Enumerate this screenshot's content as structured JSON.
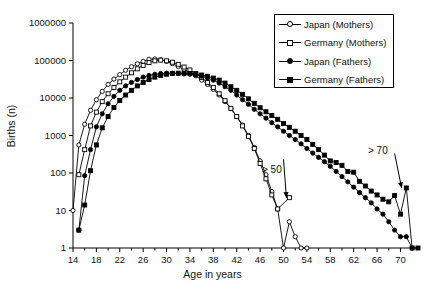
{
  "chart_data": {
    "type": "line",
    "title": "",
    "xlabel": "Age in years",
    "ylabel": "Births (n)",
    "yscale": "log",
    "ylim": [
      1,
      1000000
    ],
    "xlim": [
      14,
      73
    ],
    "yticks": [
      1,
      10,
      100,
      1000,
      10000,
      100000,
      1000000
    ],
    "ytick_labels": [
      "1",
      "10",
      "100",
      "1000",
      "10000",
      "100000",
      "1000000"
    ],
    "xticks": [
      14,
      18,
      22,
      26,
      30,
      34,
      38,
      42,
      46,
      50,
      54,
      58,
      62,
      66,
      70
    ],
    "xtick_labels": [
      "14",
      "18",
      "22",
      "26",
      "30",
      "34",
      "38",
      "42",
      "46",
      "50",
      "54",
      "58",
      "62",
      "66",
      "70"
    ],
    "x_minor_step": 2,
    "grid": false,
    "legend_position": "top-right",
    "annotations": [
      {
        "text": "> 50",
        "x": 50.5,
        "y": 22,
        "label_x": 50.0,
        "label_y": 230
      },
      {
        "text": "> 70",
        "x": 70.2,
        "y": 40,
        "label_x": 69.0,
        "label_y": 330
      }
    ],
    "series": [
      {
        "name": "Japan (Mothers)",
        "marker": "circle-open",
        "x": [
          14,
          15,
          16,
          17,
          18,
          19,
          20,
          21,
          22,
          23,
          24,
          25,
          26,
          27,
          28,
          29,
          30,
          31,
          32,
          33,
          34,
          35,
          36,
          37,
          38,
          39,
          40,
          41,
          42,
          43,
          44,
          45,
          46,
          47,
          48,
          49,
          50,
          51,
          52,
          53,
          54
        ],
        "y": [
          10,
          560,
          2000,
          4700,
          9000,
          15000,
          23000,
          32000,
          42000,
          55000,
          68000,
          82000,
          95000,
          108000,
          110000,
          105000,
          95000,
          82000,
          69000,
          58000,
          48000,
          39000,
          30000,
          23000,
          17000,
          12000,
          8000,
          5200,
          3200,
          1900,
          1000,
          480,
          210,
          90,
          32,
          11,
          1,
          5,
          2,
          1,
          1
        ]
      },
      {
        "name": "Germany (Mothers)",
        "marker": "square-open",
        "x": [
          15,
          16,
          17,
          18,
          19,
          20,
          21,
          22,
          23,
          24,
          25,
          26,
          27,
          28,
          29,
          30,
          31,
          32,
          33,
          34,
          35,
          36,
          37,
          38,
          39,
          40,
          41,
          42,
          43,
          44,
          45,
          46,
          47,
          48,
          49,
          51
        ],
        "y": [
          90,
          420,
          1800,
          4200,
          8000,
          13000,
          19000,
          27000,
          36000,
          47000,
          60000,
          74000,
          88000,
          98000,
          102000,
          98000,
          90000,
          79000,
          67000,
          56000,
          45000,
          35000,
          26000,
          19000,
          13000,
          8500,
          5300,
          3200,
          1800,
          950,
          450,
          180,
          70,
          26,
          11,
          22
        ]
      },
      {
        "name": "Japan (Fathers)",
        "marker": "circle-filled",
        "x": [
          15,
          16,
          17,
          18,
          19,
          20,
          21,
          22,
          23,
          24,
          25,
          26,
          27,
          28,
          29,
          30,
          31,
          32,
          33,
          34,
          35,
          36,
          37,
          38,
          39,
          40,
          41,
          42,
          43,
          44,
          45,
          46,
          47,
          48,
          49,
          50,
          51,
          52,
          53,
          54,
          55,
          56,
          57,
          58,
          59,
          60,
          61,
          62,
          63,
          64,
          65,
          66,
          67,
          68,
          69,
          70,
          71,
          72
        ],
        "y": [
          3,
          85,
          420,
          1700,
          3800,
          7000,
          11000,
          16000,
          21000,
          26000,
          31000,
          36000,
          40000,
          43000,
          45000,
          46000,
          46000,
          45000,
          44000,
          43000,
          41000,
          38000,
          34000,
          30000,
          25000,
          20000,
          16000,
          12000,
          9000,
          6800,
          5000,
          3800,
          2900,
          2200,
          1700,
          1300,
          1000,
          780,
          600,
          450,
          340,
          260,
          200,
          150,
          110,
          80,
          58,
          42,
          30,
          22,
          16,
          11,
          8,
          5,
          3,
          2,
          2,
          1
        ]
      },
      {
        "name": "Germany (Fathers)",
        "marker": "square-filled",
        "x": [
          15,
          16,
          17,
          18,
          19,
          20,
          21,
          22,
          23,
          24,
          25,
          26,
          27,
          28,
          29,
          30,
          31,
          32,
          33,
          34,
          35,
          36,
          37,
          38,
          39,
          40,
          41,
          42,
          43,
          44,
          45,
          46,
          47,
          48,
          49,
          50,
          51,
          52,
          53,
          54,
          55,
          56,
          57,
          58,
          59,
          60,
          61,
          62,
          63,
          64,
          65,
          66,
          67,
          68,
          69,
          70,
          71,
          72,
          73
        ],
        "y": [
          3,
          14,
          115,
          560,
          1600,
          3200,
          5600,
          8600,
          12000,
          16000,
          21000,
          26000,
          31000,
          36000,
          40000,
          43000,
          45000,
          46000,
          46000,
          45000,
          43000,
          41000,
          38000,
          34000,
          30000,
          25000,
          20000,
          16000,
          12500,
          9500,
          7200,
          5500,
          4300,
          3400,
          2700,
          2100,
          1650,
          1300,
          1000,
          780,
          580,
          420,
          300,
          210,
          190,
          160,
          110,
          105,
          60,
          45,
          33,
          26,
          20,
          17,
          25,
          8,
          40,
          1,
          1
        ]
      }
    ]
  },
  "axes": {
    "x_title": "Age in years",
    "y_title": "Births (n)"
  },
  "legend": {
    "entries": [
      {
        "label": "Japan (Mothers)",
        "marker": "circle-open"
      },
      {
        "label": "Germany (Mothers)",
        "marker": "square-open"
      },
      {
        "label": "Japan (Fathers)",
        "marker": "circle-filled"
      },
      {
        "label": "Germany (Fathers)",
        "marker": "square-filled"
      }
    ]
  },
  "annotations": {
    "gt50": "> 50",
    "gt70": "> 70"
  },
  "colors": {
    "line": "#000000",
    "background": "#ffffff",
    "axis": "#000000"
  }
}
